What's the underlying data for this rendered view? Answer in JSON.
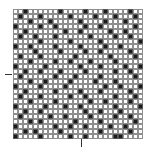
{
  "chart_data": {
    "type": "heatmap",
    "title": "",
    "xlabel": "",
    "ylabel": "",
    "rows": 26,
    "cols": 26,
    "colors": {
      "on": "#1a1a1a",
      "off": "#ffffff",
      "grid": "#8e8e8e"
    },
    "ticks": {
      "left_y_px": 74,
      "bottom_x_px": 81
    },
    "matrix": [
      "00100000010000100010000100",
      "01000100000100001000100010",
      "00010001000001000010001000",
      "10000100100000100100000010",
      "00100000001001000001001000",
      "01001000100000010000100100",
      "00000100000100000100000001",
      "10010000100001000010010000",
      "00001000010000100100000100",
      "01000100000010000001000010",
      "00010000100100010000100000",
      "10000010000001000100001001",
      "00100100010000100000100100",
      "01000000100010000100000010",
      "00010010000100001000100000",
      "10000100001000000010010001",
      "00100000100001000100000100",
      "01000100000100100000100010",
      "00010000100000010010000100",
      "10000010001001000000100001",
      "00100100000000100100010000",
      "01000001001000010000100100",
      "00010100000010000100000010",
      "10000000100100100001001000",
      "00101000010000000100000100",
      "10000100000100100000110000"
    ]
  }
}
